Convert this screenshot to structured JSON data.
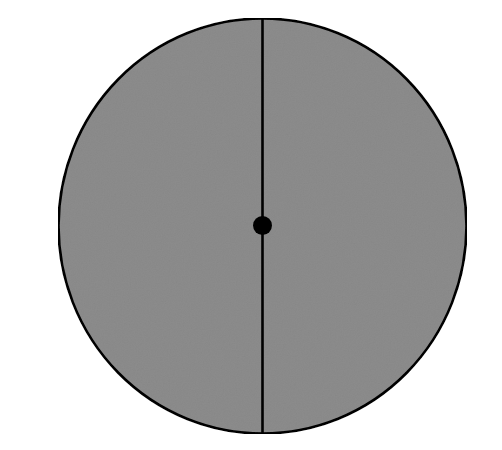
{
  "figure": {
    "title": "",
    "type": "geometric-diagram",
    "description": "Shaded circle bisected by a vertical diameter with a filled dot at the center",
    "canvas": {
      "width": 502,
      "height": 450,
      "background_color": "#ffffff"
    },
    "shapes": {
      "circle": {
        "name": "shaded-circle",
        "center_x": 262.5,
        "center_y": 226.0,
        "radius_x": 204.0,
        "radius_y": 207.5,
        "fill_color": "#8c8c8c",
        "stroke_color": "#000000",
        "stroke_width": 2.6
      },
      "diameter_line": {
        "name": "vertical-diameter",
        "x": 262.5,
        "y_top": 18.5,
        "y_bottom": 433.5,
        "stroke_color": "#000000",
        "stroke_width": 2.6,
        "orientation": "vertical"
      },
      "center_dot": {
        "name": "center-point-dot",
        "center_x": 262.5,
        "center_y": 225.5,
        "radius": 9.5,
        "fill_color": "#000000"
      }
    },
    "texture": {
      "name": "paper-grain",
      "enabled": true,
      "opacity": 0.1
    }
  }
}
